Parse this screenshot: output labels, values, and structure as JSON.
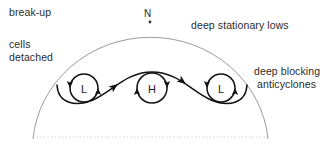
{
  "diagram": {
    "title_labels": {
      "break_up": "break-up",
      "cells": "cells",
      "detached": "detached",
      "deep_stationary_lows": "deep stationary lows",
      "deep_blocking_line1": "deep blocking",
      "deep_blocking_line2": "anticyclones",
      "north_pole": "N"
    },
    "pressure_systems": [
      {
        "label": "L",
        "type": "low",
        "cx": 84,
        "cy": 88,
        "r": 14
      },
      {
        "label": "H",
        "type": "high",
        "cx": 152,
        "cy": 88,
        "r": 15
      },
      {
        "label": "L",
        "type": "low",
        "cx": 221,
        "cy": 88,
        "r": 14
      }
    ],
    "colors": {
      "text": "#2b2b2b",
      "outer_arc": "#9a9a9a",
      "baseline_dotted": "#cfcfcf",
      "flow_line": "#111111",
      "system_ring": "#111111"
    },
    "geometry": {
      "hemisphere_arc": "M 33,139 A 118,112 0 0 1 268,139",
      "baseline_y": 137,
      "baseline_x_start": 33,
      "baseline_x_end": 268,
      "pole_dot": {
        "cx": 150,
        "cy": 22,
        "r": 1.4
      },
      "jet_stream_path": "M 57,85 C 58,104 76,107 93,100 C 112,92 126,72 152,72 C 178,72 192,92 211,100 C 228,107 246,104 247,85",
      "arrowheads": [
        {
          "x": 118,
          "y": 84,
          "angle": -36,
          "name": "jet-arrow-ascending"
        },
        {
          "x": 186,
          "y": 84,
          "angle": 36,
          "name": "jet-arrow-descending"
        }
      ]
    }
  }
}
